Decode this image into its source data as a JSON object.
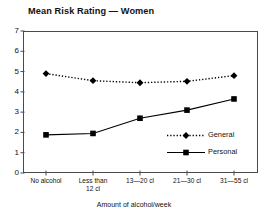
{
  "chart_data": {
    "type": "line",
    "title": "Mean Risk Rating — Women",
    "xlabel": "Amount of alcohol/week",
    "ylabel": "",
    "categories": [
      "No alcohol",
      "Less than 12 cl",
      "13—20 cl",
      "21—30 cl",
      "31—55 cl"
    ],
    "category_lines": [
      [
        "No alcohol"
      ],
      [
        "Less than",
        "12 cl"
      ],
      [
        "13—20 cl"
      ],
      [
        "21—30 cl"
      ],
      [
        "31—55 cl"
      ]
    ],
    "ylim": [
      0,
      7
    ],
    "yticks": [
      0,
      1,
      2,
      3,
      4,
      5,
      6,
      7
    ],
    "ytick_labels": [
      "0",
      "1",
      "2",
      "3",
      "4",
      "5",
      "6",
      "7"
    ],
    "grid": false,
    "legend_position": "inside-bottom-right",
    "series": [
      {
        "name": "General",
        "values": [
          4.9,
          4.55,
          4.45,
          4.52,
          4.8
        ],
        "line_style": "dotted",
        "marker": "diamond",
        "color": "#000000"
      },
      {
        "name": "Personal",
        "values": [
          1.88,
          1.95,
          2.7,
          3.1,
          3.65
        ],
        "line_style": "solid",
        "marker": "square",
        "color": "#000000"
      }
    ]
  },
  "legend": {
    "items": [
      {
        "label": "General"
      },
      {
        "label": "Personal"
      }
    ]
  },
  "colors": {
    "axis": "#4a4a4a",
    "series": "#000000",
    "background": "#ffffff"
  }
}
